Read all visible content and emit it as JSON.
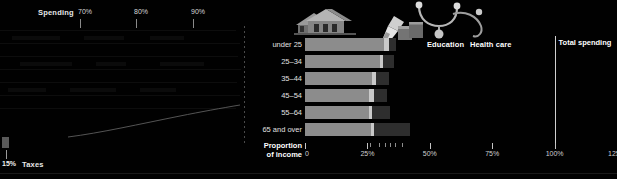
{
  "left_panel": {
    "series_label": "Spending",
    "taxes_label": "Taxes",
    "taxes_tick_label": "15%",
    "top_ticks": [
      {
        "label": "70%",
        "x": 78
      },
      {
        "label": "80%",
        "x": 134
      },
      {
        "label": "90%",
        "x": 191
      }
    ]
  },
  "right_panel": {
    "legend": [
      {
        "name": "housing-legend",
        "label": "Housing",
        "color": "#8c8c8c"
      },
      {
        "name": "education-legend",
        "label": "Education",
        "color": "#c9c9c9"
      },
      {
        "name": "health-care-legend",
        "label": "Health care",
        "color": "#2e2e2e"
      }
    ],
    "total_spending_label": "Total spending",
    "axis_title_line1": "Proportion",
    "axis_title_line2": "of income",
    "icons": [
      {
        "name": "house-icon",
        "label": "Housing"
      },
      {
        "name": "pencil-icon",
        "label": "Education"
      },
      {
        "name": "stethoscope-icon",
        "label": "Health care"
      }
    ]
  },
  "chart_data": {
    "type": "bar",
    "subtype": "stacked-horizontal",
    "title": "Proportion of income",
    "xlabel": "Proportion of income",
    "ylabel": "",
    "xlim": [
      0,
      125
    ],
    "xticks": [
      0,
      25,
      50,
      75,
      100,
      125
    ],
    "xtick_labels": [
      "0",
      "25%",
      "50%",
      "75%",
      "100%",
      "125%"
    ],
    "categories": [
      "under 25",
      "25–34",
      "35–44",
      "45–54",
      "55–64",
      "65 and over"
    ],
    "legend_position": "top",
    "grid": false,
    "reference_line": {
      "label": "Total spending",
      "value": 100
    },
    "series": [
      {
        "name": "Housing",
        "color": "#8c8c8c",
        "values": [
          31.5,
          30.0,
          27.0,
          25.5,
          25.5,
          26.5
        ]
      },
      {
        "name": "Education",
        "color": "#c9c9c9",
        "values": [
          2.0,
          1.2,
          1.5,
          2.0,
          1.5,
          1.0
        ]
      },
      {
        "name": "Health care",
        "color": "#2e2e2e",
        "values": [
          3.0,
          4.5,
          5.0,
          5.5,
          7.0,
          14.5
        ]
      }
    ],
    "totals": [
      36.5,
      35.7,
      33.5,
      33.0,
      34.0,
      42.0
    ],
    "minor_tick_values": [
      26,
      29.5,
      32,
      34,
      36,
      39
    ]
  }
}
